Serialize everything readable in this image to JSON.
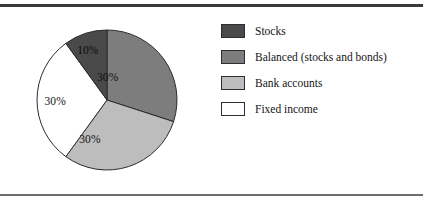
{
  "figure": {
    "name": "asset-allocation-pie-figure",
    "background_color": "#ffffff",
    "top_rule_color": "#3a3a3a",
    "bottom_rule_color": "#6e6e6e"
  },
  "chart_data": {
    "type": "pie",
    "title": "",
    "subtitle": "",
    "xlabel": "",
    "ylabel": "",
    "grid": false,
    "legend_position": "right",
    "start_angle_deg": 0,
    "direction": "clockwise",
    "units": "percent",
    "total": 100,
    "categories": [
      "Stocks",
      "Balanced (stocks and bonds)",
      "Bank accounts",
      "Fixed income"
    ],
    "values": [
      10,
      30,
      30,
      30
    ],
    "data_labels": [
      "10%",
      "30%",
      "30%",
      "30%"
    ],
    "colors": [
      "#4a4a4a",
      "#7d7d7d",
      "#bdbdbd",
      "#ffffff"
    ],
    "slice_edge_color": "#2b2b2b",
    "slices": [
      {
        "label": "Balanced (stocks and bonds)",
        "value": 30,
        "data_label": "30%",
        "color": "#7d7d7d",
        "start_deg": 0,
        "end_deg": 108,
        "label_x_pct": 50.5,
        "label_y_pct": 34.0,
        "label_on_dark": true
      },
      {
        "label": "Bank accounts",
        "value": 30,
        "data_label": "30%",
        "color": "#bdbdbd",
        "start_deg": 108,
        "end_deg": 216,
        "label_x_pct": 38.0,
        "label_y_pct": 77.5,
        "label_on_dark": false
      },
      {
        "label": "Fixed income",
        "value": 30,
        "data_label": "30%",
        "color": "#ffffff",
        "start_deg": 216,
        "end_deg": 324,
        "label_x_pct": 13.5,
        "label_y_pct": 50.5,
        "label_on_dark": false
      },
      {
        "label": "Stocks",
        "value": 10,
        "data_label": "10%",
        "color": "#4a4a4a",
        "start_deg": 324,
        "end_deg": 360,
        "label_x_pct": 36.5,
        "label_y_pct": 14.5,
        "label_on_dark": true
      }
    ],
    "legend": [
      {
        "label": "Stocks",
        "color": "#4a4a4a",
        "value": 10
      },
      {
        "label": "Balanced (stocks and bonds)",
        "color": "#7d7d7d",
        "value": 30
      },
      {
        "label": "Bank accounts",
        "color": "#bdbdbd",
        "value": 30
      },
      {
        "label": "Fixed income",
        "color": "#ffffff",
        "value": 30
      }
    ]
  }
}
